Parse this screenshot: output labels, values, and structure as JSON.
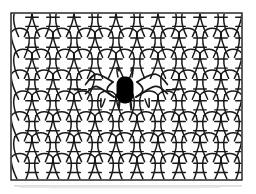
{
  "figure": {
    "title": "Knitted fabric structure diagram with central stitch defect",
    "type": "line-art-illustration",
    "background_color": "#ffffff",
    "line_color": "#1a1a1a",
    "defect_color": "#000000",
    "frame": {
      "label": "fabric-swatch-border",
      "x": 11,
      "y": 13,
      "width": 231,
      "height": 167,
      "stroke_width": 1.4,
      "stroke_color": "#1a1a1a",
      "fill": "#ffffff"
    },
    "shadow": {
      "label": "bottom-edge-shadow",
      "color": "#b8b4b4",
      "opacity": 0.55
    },
    "grid": {
      "columns": 11,
      "rows": 8,
      "column_pitch": 21.0,
      "row_pitch": 21.0,
      "loop_stroke_width": 1.5,
      "bar_stroke_width": 1.4,
      "loop_body_fill": "#ffffff"
    },
    "defect": {
      "label": "broken-stitch-marker",
      "shape": "rounded-blob",
      "center_x": 125,
      "center_y": 90,
      "width": 17,
      "height": 27,
      "fill": "#000000",
      "description": "solid black filled stitch indicating a dropped or broken loop"
    },
    "run": {
      "label": "horizontal-stitch-run",
      "row_index": 3,
      "left_extent_x": 95,
      "right_extent_x": 160,
      "description": "loops on the defect row stretch horizontally toward the black marker forming arched distorted courses"
    }
  }
}
